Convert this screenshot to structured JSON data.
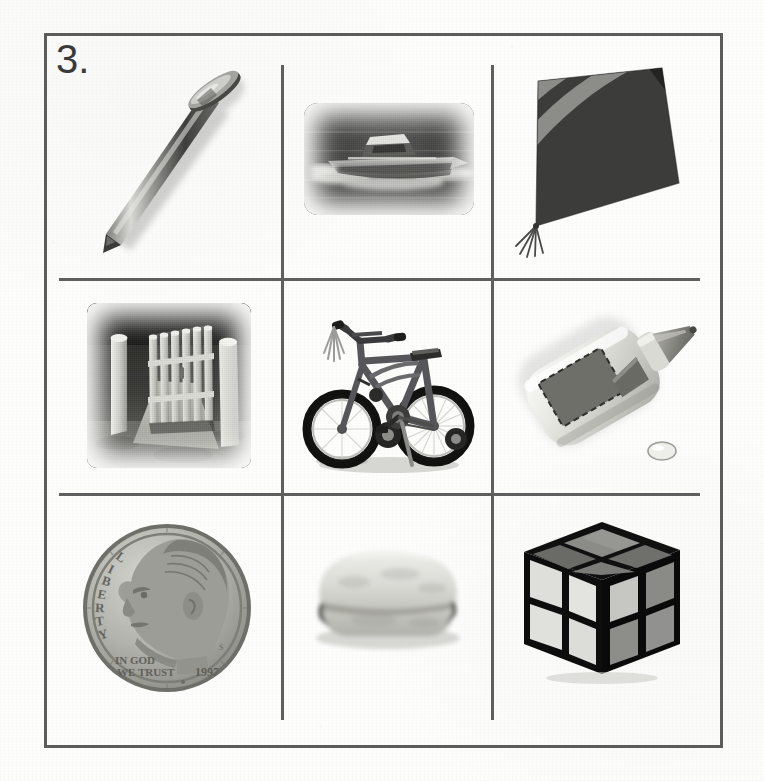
{
  "worksheet": {
    "question_number": "3.",
    "layout": {
      "rows": 3,
      "columns": 3
    },
    "palette": {
      "paper": "#fdfdfc",
      "grid_line": "#5f5f5f",
      "frame_line": "#5c5c5c",
      "label_text": "#3a3a3a",
      "photo_dark": "#2b2b2b",
      "photo_mid": "#7d7d7d",
      "photo_light": "#d9d9d6"
    }
  },
  "cells": [
    {
      "position": "row1-col1",
      "row": 1,
      "column": 1,
      "icon_name": "nail-photo",
      "label": "nail",
      "description": "Close-up grayscale photo of a single steel nail angled from lower-left to upper-right with a flat round head at the top-right and a sharp point at the lower-left, casting a soft shadow."
    },
    {
      "position": "row1-col2",
      "row": 1,
      "column": 2,
      "icon_name": "boat-photo",
      "label": "boat",
      "description": "Dark vignetted grayscale photo of a motorboat or yacht speeding across dark water, throwing up white spray, framed in a soft rounded-rectangle vignette."
    },
    {
      "position": "row1-col3",
      "row": 1,
      "column": 3,
      "icon_name": "kite-illustration",
      "label": "kite",
      "description": "Diamond-shaped kite tilted to the right with curved diagonal bands alternating dark charcoal and medium gray, with a short fringe of tassels trailing from the bottom-left tip."
    },
    {
      "position": "row2-col1",
      "row": 2,
      "column": 1,
      "icon_name": "gate-photo",
      "label": "gate",
      "description": "Vignetted grayscale photo of an open white wooden picket gate with pointed pickets and two posts, standing on a path with dark foliage behind it."
    },
    {
      "position": "row2-col2",
      "row": 2,
      "column": 2,
      "icon_name": "bike-photo",
      "label": "bike",
      "description": "Grayscale photo of a child's BMX-style bicycle seen from the front-left, with streamer tassels on the left handlebar grip, training wheels on the rear, and a kickstand, on a plain pale background."
    },
    {
      "position": "row2-col3",
      "row": 2,
      "column": 3,
      "icon_name": "glue-photo",
      "label": "glue",
      "description": "White plastic glue bottle tilted diagonally with a dark rectangular label on its face, an orange-gray tapered applicator tip at the lower right, and a single drop of glue beneath the tip."
    },
    {
      "position": "row3-col1",
      "row": 3,
      "column": 1,
      "icon_name": "dime-photo",
      "label": "dime",
      "description": "Close-up grayscale photo of a United States dime showing the profile of Franklin D. Roosevelt facing left.",
      "coin_inscriptions": [
        "LIBERTY",
        "IN GOD WE TRUST",
        "1997"
      ]
    },
    {
      "position": "row3-col2",
      "row": 3,
      "column": 2,
      "icon_name": "bun-photo",
      "label": "bun",
      "description": "Pale grayscale photo of a sliced bread roll or hamburger bun viewed from the side, with a rounded top and a visible horizontal seam."
    },
    {
      "position": "row3-col3",
      "row": 3,
      "column": 3,
      "icon_name": "cube-photo",
      "label": "cube",
      "description": "Grayscale photo of a 2x2 twisty puzzle cube seen in three-quarter view with black edges and square stickers in light gray, mid gray, and dark gray."
    }
  ]
}
